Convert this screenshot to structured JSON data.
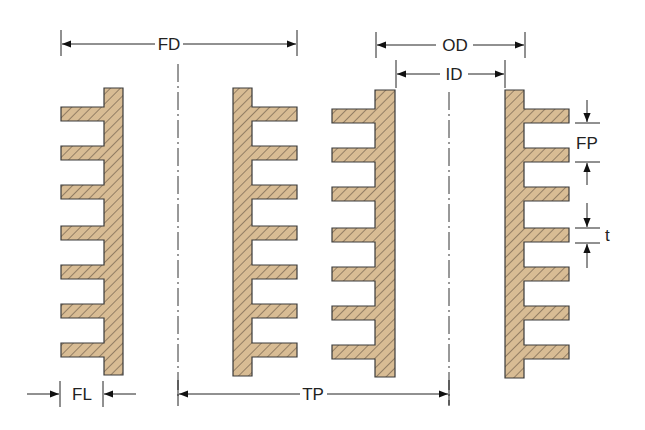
{
  "diagram": {
    "colors": {
      "fill": "#d8bc94",
      "outline": "#3a3a3a",
      "hatch": "#4a4038",
      "dim_line": "#222222"
    },
    "labels": {
      "fd": "FD",
      "od": "OD",
      "id": "ID",
      "fp": "FP",
      "t": "t",
      "fl": "FL",
      "tp": "TP"
    },
    "dimension_meanings": {
      "fd": "Fin diameter",
      "od": "Outside diameter",
      "id": "Inside diameter",
      "fp": "Fin pitch",
      "t": "Fin thickness",
      "fl": "Fin length",
      "tp": "Tube pitch"
    },
    "tubes": [
      {
        "name": "tube-1-left-wall",
        "fins_side": "left"
      },
      {
        "name": "tube-1-right-wall",
        "fins_side": "right"
      },
      {
        "name": "tube-2-left-wall",
        "fins_side": "left"
      },
      {
        "name": "tube-2-right-wall",
        "fins_side": "right"
      }
    ],
    "fins_per_wall": 7
  }
}
